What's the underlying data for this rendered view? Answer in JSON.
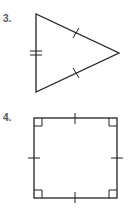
{
  "problems": [
    {
      "number": "3.",
      "shape": "isosceles-triangle",
      "marks": {
        "single_tick_sides": 2,
        "double_tick_sides": 1
      }
    },
    {
      "number": "4.",
      "shape": "square",
      "marks": {
        "single_tick_sides": 4,
        "right_angles": 4
      }
    }
  ],
  "colors": {
    "stroke": "#222222",
    "label": "#555555"
  }
}
